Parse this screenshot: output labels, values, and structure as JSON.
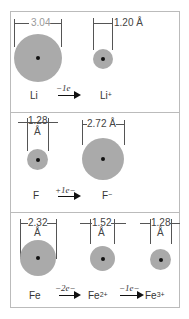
{
  "panels": [
    {
      "name": "lithium",
      "atom": {
        "symbol": "Li",
        "diameter": "3.04"
      },
      "ion": {
        "symbol": "Li",
        "charge": "+",
        "diameter": "1.20 Å"
      },
      "transition": "−1e"
    },
    {
      "name": "fluorine",
      "atom": {
        "symbol": "F",
        "diameter": "1.28",
        "unit": "Å"
      },
      "ion": {
        "symbol": "F",
        "charge": "−",
        "diameter": "2.72 Å"
      },
      "transition": "+1e−"
    },
    {
      "name": "iron",
      "atom": {
        "symbol": "Fe",
        "diameter": "2.32",
        "unit": "Å"
      },
      "ion1": {
        "symbol": "Fe",
        "charge": "2+",
        "diameter": "1.52",
        "unit": "Å"
      },
      "ion2": {
        "symbol": "Fe",
        "charge": "3+",
        "diameter": "1.28",
        "unit": "Å"
      },
      "transition1": "−2e−",
      "transition2": "−1e−"
    }
  ],
  "colors": {
    "atom_fill": "#aaaaaa",
    "nucleus": "#111111",
    "border": "#bbbbbb"
  }
}
